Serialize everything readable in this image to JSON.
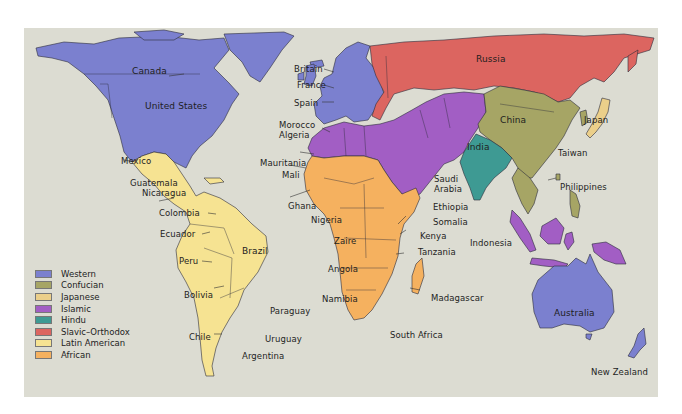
{
  "map": {
    "title": "Civilizations of the World",
    "background_color": "#dcdcd2",
    "page_color": "#ffffff"
  },
  "legend": {
    "items": [
      {
        "label": "Western",
        "color": "#7b80cf"
      },
      {
        "label": "Confucian",
        "color": "#a6a565"
      },
      {
        "label": "Japanese",
        "color": "#ebcf8a"
      },
      {
        "label": "Islamic",
        "color": "#a25ec4"
      },
      {
        "label": "Hindu",
        "color": "#3e9a93"
      },
      {
        "label": "Slavic–Orthodox",
        "color": "#dc6560"
      },
      {
        "label": "Latin American",
        "color": "#f6e392"
      },
      {
        "label": "African",
        "color": "#f5b15f"
      }
    ]
  },
  "labels": {
    "canada": "Canada",
    "united_states": "United States",
    "mexico": "Mexico",
    "guatemala": "Guatemala",
    "nicaragua": "Nicaragua",
    "colombia": "Colombia",
    "ecuador": "Ecuador",
    "peru": "Peru",
    "brazil": "Brazil",
    "bolivia": "Bolivia",
    "paraguay": "Paraguay",
    "chile": "Chile",
    "uruguay": "Uruguay",
    "argentina": "Argentina",
    "britain": "Britain",
    "france": "France",
    "spain": "Spain",
    "morocco": "Morocco",
    "algeria": "Algeria",
    "mauritania": "Mauritania",
    "mali": "Mali",
    "ghana": "Ghana",
    "nigeria": "Nigeria",
    "zaire": "Zaire",
    "angola": "Angola",
    "namibia": "Namibia",
    "south_africa": "South Africa",
    "saudi_arabia_1": "Saudi",
    "saudi_arabia_2": "Arabia",
    "ethiopia": "Ethiopia",
    "somalia": "Somalia",
    "kenya": "Kenya",
    "tanzania": "Tanzania",
    "madagascar": "Madagascar",
    "russia": "Russia",
    "china": "China",
    "india": "India",
    "japan": "Japan",
    "taiwan": "Taiwan",
    "philippines": "Philippines",
    "indonesia": "Indonesia",
    "australia": "Australia",
    "new_zealand": "New Zealand"
  }
}
